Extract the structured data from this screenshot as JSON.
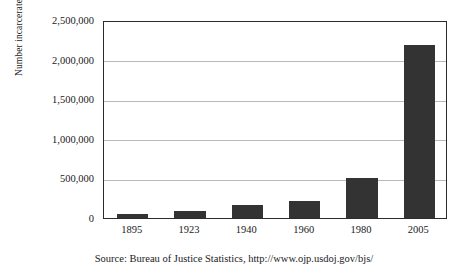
{
  "chart_data": {
    "type": "bar",
    "title": "",
    "subtitle": "",
    "xlabel": "",
    "ylabel": "Number incarcerated",
    "categories": [
      "1895",
      "1923",
      "1940",
      "1960",
      "1980",
      "2005"
    ],
    "values": [
      50000,
      85000,
      165000,
      210000,
      500000,
      2185000
    ],
    "ylim": [
      0,
      2500000
    ],
    "ytick_values": [
      0,
      500000,
      1000000,
      1500000,
      2000000,
      2500000
    ],
    "ytick_labels": [
      "0",
      "500,000",
      "1,000,000",
      "1,500,000",
      "2,000,000",
      "2,500,000"
    ],
    "grid": true,
    "grid_axis": "y",
    "legend": false,
    "legend_position": "none",
    "bar_color": "#333333",
    "gridline_color": "#b9b9b9",
    "frame_color": "#2b2b2b",
    "background_color": "#ffffff",
    "annotations": [
      "Source: Bureau of Justice Statistics, http://www.ojp.usdoj.gov/bjs/"
    ]
  },
  "caption": {
    "source_text": "Source: Bureau of Justice Statistics, http://www.ojp.usdoj.gov/bjs/"
  }
}
